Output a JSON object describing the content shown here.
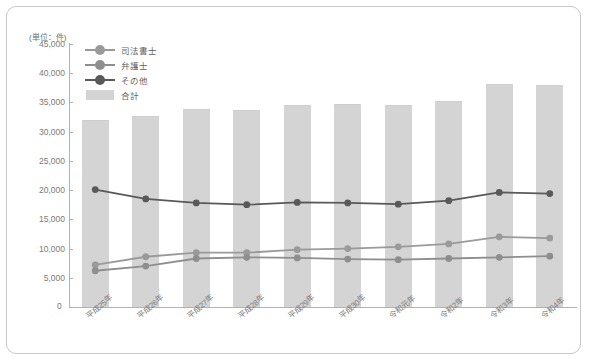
{
  "chart_data": {
    "type": "bar",
    "title": "",
    "unit_caption": "(単位：件)",
    "xlabel": "",
    "ylabel": "",
    "ylim": [
      0,
      45000
    ],
    "ytick_step": 5000,
    "yticks": [
      "45,000",
      "40,000",
      "35,000",
      "30,000",
      "25,000",
      "20,000",
      "15,000",
      "10,000",
      "5,000",
      "0"
    ],
    "ytick_values": [
      45000,
      40000,
      35000,
      30000,
      25000,
      20000,
      15000,
      10000,
      5000,
      0
    ],
    "grid": false,
    "legend_position": "top-left",
    "categories": [
      "平成25年",
      "平成26年",
      "平成27年",
      "平成28年",
      "平成29年",
      "平成30年",
      "令和元年",
      "令和2年",
      "令和3年",
      "令和4年"
    ],
    "series": [
      {
        "name": "合計",
        "kind": "bar",
        "color": "#d4d4d4",
        "values": [
          32000,
          32700,
          33900,
          33700,
          34500,
          34800,
          34500,
          35300,
          38100,
          38000
        ]
      },
      {
        "name": "その他",
        "kind": "line",
        "color": "#595959",
        "values": [
          20100,
          18500,
          17800,
          17500,
          17900,
          17800,
          17600,
          18200,
          19600,
          19400
        ]
      },
      {
        "name": "司法書士",
        "kind": "line",
        "color": "#9a9a9a",
        "values": [
          7200,
          8600,
          9300,
          9300,
          9800,
          10000,
          10300,
          10800,
          12000,
          11800
        ]
      },
      {
        "name": "弁護士",
        "kind": "line",
        "color": "#8e8e8e",
        "values": [
          6200,
          7000,
          8300,
          8500,
          8400,
          8200,
          8100,
          8300,
          8500,
          8700
        ]
      }
    ]
  },
  "legend": {
    "items": [
      {
        "label": "司法書士",
        "marker": "line-dot",
        "color": "#9a9a9a"
      },
      {
        "label": "弁護士",
        "marker": "line-dot",
        "color": "#8e8e8e"
      },
      {
        "label": "その他",
        "marker": "line-dot",
        "color": "#595959"
      },
      {
        "label": "合計",
        "marker": "swatch",
        "color": "#d4d4d4"
      }
    ]
  },
  "axis": {
    "zero_label": "0"
  }
}
